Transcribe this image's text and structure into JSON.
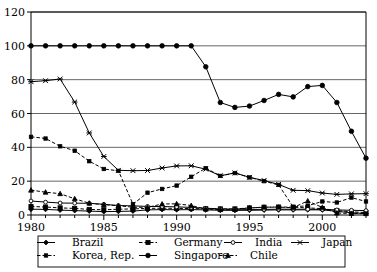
{
  "chart_data": {
    "type": "line",
    "title": "",
    "xlabel": "",
    "ylabel": "",
    "xlim": [
      1980,
      2003
    ],
    "ylim": [
      0,
      120
    ],
    "yticks": [
      0,
      20,
      40,
      60,
      80,
      100,
      120
    ],
    "xticks": [
      1980,
      1985,
      1990,
      1995,
      2000
    ],
    "xtick_labels": [
      "1980",
      "1985",
      "1990",
      "1995",
      "2000"
    ],
    "ytick_labels": [
      "0",
      "20",
      "40",
      "60",
      "80",
      "100",
      "120"
    ],
    "grid": "horizontal",
    "legend_position": "bottom",
    "x": [
      1980,
      1981,
      1982,
      1983,
      1984,
      1985,
      1986,
      1987,
      1988,
      1989,
      1990,
      1991,
      1992,
      1993,
      1994,
      1995,
      1996,
      1997,
      1998,
      1999,
      2000,
      2001,
      2002,
      2003
    ],
    "series": [
      {
        "name": "Brazil",
        "marker": "diamond",
        "line": "solid",
        "values": [
          3.4,
          3.3,
          2.9,
          2.6,
          2.3,
          2.0,
          2.1,
          2.3,
          3.0,
          3.2,
          3.1,
          3.2,
          3.0,
          2.8,
          2.7,
          2.8,
          2.9,
          3.0,
          3.0,
          3.1,
          3.0,
          2.2,
          1.3,
          0.9
        ]
      },
      {
        "name": "Germany",
        "marker": "square",
        "line": "dashed",
        "values": [
          5.0,
          4.7,
          4.2,
          3.9,
          3.3,
          3.1,
          3.4,
          3.6,
          3.9,
          4.0,
          3.9,
          3.8,
          3.7,
          3.6,
          3.6,
          4.2,
          4.6,
          4.7,
          4.6,
          4.2,
          3.8,
          2.6,
          1.9,
          1.4
        ]
      },
      {
        "name": "India",
        "marker": "circle-open",
        "line": "solid",
        "values": [
          8.3,
          7.6,
          7.1,
          7.0,
          6.9,
          6.3,
          5.6,
          5.4,
          5.1,
          5.0,
          4.8,
          4.5,
          4.0,
          3.6,
          3.4,
          3.3,
          3.3,
          3.4,
          3.4,
          3.4,
          3.3,
          3.0,
          2.8,
          2.6
        ]
      },
      {
        "name": "Japan",
        "marker": "x",
        "line": "solid",
        "values": [
          78.8,
          79.4,
          80.4,
          66.8,
          48.5,
          34.6,
          26.4,
          26.2,
          26.3,
          27.8,
          29.0,
          29.1,
          27.1,
          23.2,
          24.9,
          22.3,
          20.4,
          18.1,
          14.6,
          14.4,
          13.0,
          12.2,
          12.5,
          12.6
        ]
      },
      {
        "name": "Korea, Rep.",
        "marker": "square-small",
        "line": "dashed",
        "values": [
          46.2,
          45.2,
          40.6,
          38.0,
          31.8,
          27.2,
          26.1,
          6.4,
          13.2,
          15.4,
          17.4,
          22.6,
          27.7,
          23.1,
          24.8,
          22.2,
          20.0,
          17.8,
          4.8,
          5.5,
          8.0,
          7.4,
          10.3,
          8.0
        ]
      },
      {
        "name": "Singapore",
        "marker": "circle",
        "line": "solid",
        "values": [
          100,
          100,
          100,
          100,
          100,
          100,
          100,
          100,
          100,
          100,
          100,
          100,
          87.6,
          66.5,
          63.6,
          64.4,
          67.7,
          71.3,
          69.8,
          75.9,
          76.6,
          66.5,
          49.5,
          33.6
        ]
      },
      {
        "name": "Chile",
        "marker": "triangle",
        "line": "dashed",
        "values": [
          14.7,
          13.5,
          12.6,
          9.6,
          7.0,
          6.1,
          5.5,
          4.6,
          4.5,
          6.5,
          6.6,
          5.6,
          3.5,
          3.2,
          3.3,
          4.2,
          4.6,
          4.6,
          4.4,
          8.3,
          4.5,
          1.2,
          0.9,
          0.8
        ]
      }
    ]
  },
  "legend": {
    "items": [
      {
        "label": "Brazil"
      },
      {
        "label": "Germany"
      },
      {
        "label": "India"
      },
      {
        "label": "Japan"
      },
      {
        "label": "Korea, Rep."
      },
      {
        "label": "Singapore"
      },
      {
        "label": "Chile"
      }
    ]
  },
  "colors": {
    "line": "#000000",
    "grid": "#555555",
    "background": "#ffffff"
  }
}
